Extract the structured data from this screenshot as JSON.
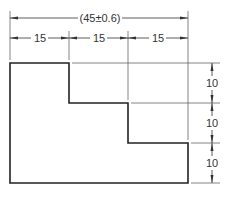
{
  "drawing": {
    "overall_dimension": "(45±0.6)",
    "horizontal_dimensions": [
      "15",
      "15",
      "15"
    ],
    "vertical_dimensions": [
      "10",
      "10",
      "10"
    ],
    "line_color": "#222222",
    "thin_line_color": "#555555"
  }
}
